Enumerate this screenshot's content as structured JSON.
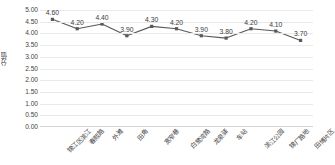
{
  "chart_data": {
    "type": "line",
    "title": "",
    "xlabel": "",
    "ylabel": "分值",
    "ylim": [
      0.0,
      5.0
    ],
    "ytick_step": 0.5,
    "grid": true,
    "legend": false,
    "series_color": "#595959",
    "marker": "square",
    "data_labels": true,
    "label_format": "0.00",
    "categories": [
      "锦江区滨江",
      "春熙路",
      "外滩",
      "田角",
      "宽窄巷",
      "白鹭湾路",
      "龙泉驿",
      "车站",
      "滨江公园",
      "锦厂路地",
      "田博片区"
    ],
    "values": [
      4.6,
      4.2,
      4.4,
      3.9,
      4.3,
      4.2,
      3.9,
      3.8,
      4.2,
      4.1,
      3.7
    ],
    "value_labels": [
      "4.60",
      "4.20",
      "4.40",
      "3.90",
      "4.30",
      "4.20",
      "3.90",
      "3.80",
      "4.20",
      "4.10",
      "3.70"
    ],
    "ytick_labels": [
      "5.00",
      "4.50",
      "4.00",
      "3.50",
      "3.00",
      "2.50",
      "2.00",
      "1.50",
      "1.00",
      "0.50",
      "0.00"
    ],
    "yticks": [
      5.0,
      4.5,
      4.0,
      3.5,
      3.0,
      2.5,
      2.0,
      1.5,
      1.0,
      0.5,
      0.0
    ]
  }
}
